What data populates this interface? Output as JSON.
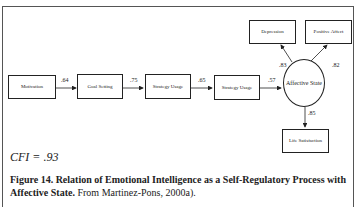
{
  "diagram": {
    "nodes": {
      "motivation": "Motivation",
      "goal_setting": "Goal Setting",
      "strategy_usage_1": "Strategy Usage",
      "strategy_usage_2": "Strategy Usage",
      "affective_state": "Affective State",
      "depression": "Depression",
      "positive_affect": "Positive Affect",
      "life_satisfaction": "Life Satisfaction"
    },
    "paths": [
      {
        "from": "Motivation",
        "to": "Goal Setting",
        "coef": ".64"
      },
      {
        "from": "Goal Setting",
        "to": "Strategy Usage",
        "coef": ".75"
      },
      {
        "from": "Strategy Usage",
        "to": "Strategy Usage",
        "coef": ".65"
      },
      {
        "from": "Strategy Usage",
        "to": "Affective State",
        "coef": ".57"
      },
      {
        "from": "Affective State",
        "to": "Depression",
        "coef": ".83"
      },
      {
        "from": "Affective State",
        "to": "Positive Affect",
        "coef": ".82"
      },
      {
        "from": "Affective State",
        "to": "Life Satisfaction",
        "coef": ".85"
      }
    ],
    "fit": "CFI = .93"
  },
  "caption": {
    "bold": "Figure 14.  Relation of Emotional Intelligence as a Self-Regulatory Process with Affective State.",
    "normal": " From Martinez-Pons, 2000a)."
  }
}
